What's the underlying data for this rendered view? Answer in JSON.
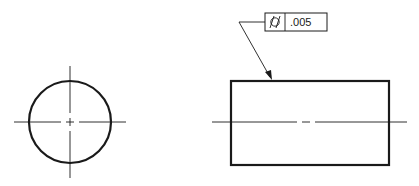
{
  "drawing": {
    "type": "engineering-drawing",
    "views": [
      "end-view-circle",
      "side-view-rectangle"
    ],
    "feature_control_frame": {
      "symbol_name": "cylindricity",
      "symbol_glyph": "⌭",
      "tolerance": ".005"
    },
    "colors": {
      "line": "#1a1a1a",
      "background": "#ffffff"
    }
  }
}
